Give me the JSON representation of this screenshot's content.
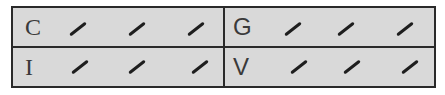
{
  "grid": {
    "rows": [
      {
        "cells": [
          {
            "label": "C",
            "marks": [
              "/",
              "/",
              "/"
            ]
          },
          {
            "label": "G",
            "marks": [
              "/",
              "/",
              "/"
            ]
          }
        ]
      },
      {
        "cells": [
          {
            "label": "I",
            "marks": [
              "/",
              "/",
              "/"
            ]
          },
          {
            "label": "V",
            "marks": [
              "/",
              "/",
              "/"
            ]
          }
        ]
      }
    ]
  },
  "colors": {
    "cell_fill": "#d9d9d9",
    "border": "#2a2a2a",
    "mark": "#1e1e1e",
    "text": "#3a3a3a"
  }
}
